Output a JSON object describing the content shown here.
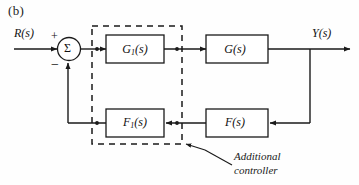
{
  "figure": {
    "panel_label": "(b)",
    "background_color": "#fefefe",
    "line_color": "#1a1a1a"
  },
  "signals": {
    "input_label": "R(s)",
    "output_label": "Y(s)"
  },
  "summing_junction": {
    "symbol": "Σ",
    "positive_sign": "+",
    "negative_sign": "−"
  },
  "blocks": [
    {
      "id": "forward-controller",
      "label": "G",
      "subscript": "1",
      "suffix": "(s)"
    },
    {
      "id": "plant",
      "label": "G",
      "subscript": "",
      "suffix": "(s)"
    },
    {
      "id": "feedback-controller",
      "label": "F",
      "subscript": "1",
      "suffix": "(s)"
    },
    {
      "id": "feedback-sensor",
      "label": "F",
      "subscript": "",
      "suffix": "(s)"
    }
  ],
  "annotation": {
    "line1": "Additional",
    "line2": "controller"
  },
  "dashed_region": {
    "name": "additional-controller-boundary",
    "stroke_dash": "6 5"
  }
}
